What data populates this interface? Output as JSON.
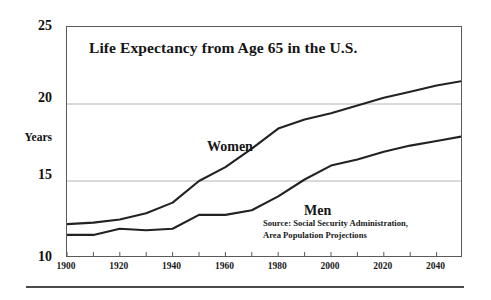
{
  "chart_data": {
    "type": "line",
    "title": "Life Expectancy from Age 65 in the U.S.",
    "xlabel": "",
    "ylabel": "Years",
    "xlim": [
      1900,
      2050
    ],
    "ylim": [
      10,
      25
    ],
    "yticks": [
      10,
      15,
      20,
      25
    ],
    "xticks": [
      1900,
      1920,
      1940,
      1960,
      1980,
      2000,
      2020,
      2040
    ],
    "xminor_ticks": [
      1910,
      1930,
      1950,
      1970,
      1990,
      2010,
      2030,
      2050
    ],
    "grid": "horizontal gridlines at 15 and 20",
    "legend_position": "inline labels on curves",
    "annotations": [
      "Source: Social Security Administration,",
      "Area Population Projections"
    ],
    "x": [
      1900,
      1910,
      1920,
      1930,
      1940,
      1950,
      1960,
      1970,
      1980,
      1990,
      2000,
      2010,
      2020,
      2030,
      2040,
      2050
    ],
    "series": [
      {
        "name": "Women",
        "values": [
          12.2,
          12.3,
          12.5,
          12.9,
          13.6,
          15.0,
          15.9,
          17.1,
          18.4,
          19.0,
          19.4,
          19.9,
          20.4,
          20.8,
          21.2,
          21.5
        ]
      },
      {
        "name": "Men",
        "values": [
          11.5,
          11.5,
          11.9,
          11.8,
          11.9,
          12.8,
          12.8,
          13.1,
          14.0,
          15.1,
          16.0,
          16.4,
          16.9,
          17.3,
          17.6,
          17.9
        ]
      }
    ]
  },
  "axes": {
    "y_ticks": [
      {
        "label": "25"
      },
      {
        "label": "20"
      },
      {
        "label": "15"
      },
      {
        "label": "10"
      }
    ],
    "y_axis_name": "Years",
    "x_ticks": [
      {
        "label": "1900"
      },
      {
        "label": "1920"
      },
      {
        "label": "1940"
      },
      {
        "label": "1960"
      },
      {
        "label": "1980"
      },
      {
        "label": "2000"
      },
      {
        "label": "2020"
      },
      {
        "label": "2040"
      }
    ]
  },
  "labels": {
    "title": "Life Expectancy from Age 65 in the U.S.",
    "women": "Women",
    "men": "Men",
    "source_line1": "Source: Social Security Administration,",
    "source_line2": "Area Population Projections"
  },
  "colors": {
    "line": "#222222",
    "grid": "#b4b4b4",
    "frame": "#5a5a5a",
    "text": "#111111",
    "background": "#ffffff"
  }
}
